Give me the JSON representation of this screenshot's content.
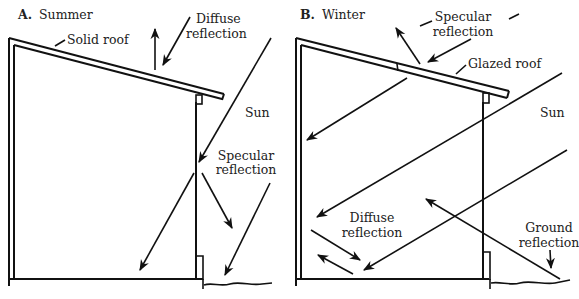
{
  "panels": [
    {
      "id": "A",
      "letter": "A.",
      "title": "Summer",
      "labels": {
        "roof": "Solid roof",
        "diffuse1": "Diffuse",
        "diffuse2": "reflection",
        "sun": "Sun",
        "specular1": "Specular",
        "specular2": "reflection"
      }
    },
    {
      "id": "B",
      "letter": "B.",
      "title": "Winter",
      "labels": {
        "specular1": "Specular",
        "specular2": "reflection",
        "roof": "Glazed roof",
        "sun": "Sun",
        "diffuse1": "Diffuse",
        "diffuse2": "reflection",
        "ground1": "Ground",
        "ground2": "reflection"
      }
    }
  ],
  "colors": {
    "ink": "#111111",
    "background": "#ffffff"
  }
}
